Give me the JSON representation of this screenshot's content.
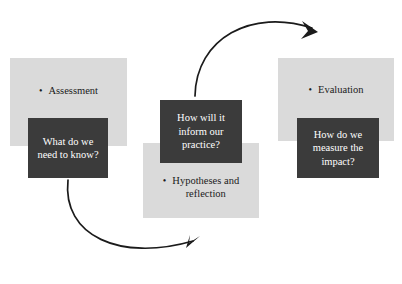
{
  "diagram": {
    "type": "cycle-diagram",
    "background_color": "#ffffff",
    "light_box_color": "#dadada",
    "dark_box_color": "#3b3b3b",
    "arrow_color": "#1b1b1b",
    "stages": [
      {
        "id": "assessment",
        "heading": "Assessment",
        "bullet_glyph": "•",
        "question": "What do we\nneed to know?",
        "question_line1": "What do we",
        "question_line2": "need to know?"
      },
      {
        "id": "hypotheses",
        "heading": "Hypotheses and reflection",
        "heading_line1": "Hypotheses and",
        "heading_line2": "reflection",
        "bullet_glyph": "•",
        "question": "How will it inform our practice?",
        "question_line1": "How will it",
        "question_line2": "inform our",
        "question_line3": "practice?"
      },
      {
        "id": "evaluation",
        "heading": "Evaluation",
        "bullet_glyph": "•",
        "question": "How do we measure the impact?",
        "question_line1": "How do we",
        "question_line2": "measure the",
        "question_line3": "impact?"
      }
    ],
    "arrows": [
      {
        "id": "arrow-hypotheses-to-evaluation",
        "from": "hypotheses",
        "to": "evaluation",
        "direction": "clockwise-top"
      },
      {
        "id": "arrow-assessment-to-hypotheses",
        "from": "assessment",
        "to": "hypotheses",
        "direction": "clockwise-bottom"
      }
    ]
  }
}
